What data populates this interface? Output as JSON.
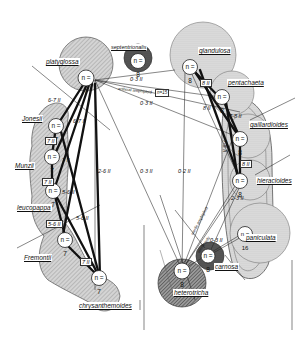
{
  "diagram": {
    "type": "species relationship / hybridization diagram",
    "colors": {
      "hatch_light": "#bdbdbd",
      "hatch_dark": "#555555",
      "line": "#111111",
      "background": "#ffffff"
    },
    "species": [
      {
        "id": "platyglossa",
        "label": "platyglossa",
        "chromosome": "n = 7",
        "shade": "dark-hatched"
      },
      {
        "id": "septentrionalis",
        "label": "septentrionalis",
        "chromosome": "n = 8",
        "shade": "dark"
      },
      {
        "id": "glandulosa",
        "label": "glandulosa",
        "chromosome": "n = 8",
        "shade": "light"
      },
      {
        "id": "pentachaeta",
        "label": "pentachaeta",
        "chromosome": "n = 8",
        "shade": "light"
      },
      {
        "id": "gaillardioides",
        "label": "gaillardioides",
        "chromosome": "n = 8",
        "shade": "light"
      },
      {
        "id": "hieracioides",
        "label": "hieracioides",
        "chromosome": "n = 8",
        "shade": "light"
      },
      {
        "id": "paniculata",
        "label": "paniculata",
        "chromosome": "n = 16",
        "shade": "light"
      },
      {
        "id": "carnosa",
        "label": "carnosa",
        "chromosome": "n = 8",
        "shade": "dark"
      },
      {
        "id": "heterotricha",
        "label": "heterotricha",
        "chromosome": "n = 8",
        "shade": "dark"
      },
      {
        "id": "Jonesii",
        "label": "Jonesii",
        "chromosome": "n = 7",
        "shade": "hatched"
      },
      {
        "id": "Munzii",
        "label": "Munzii",
        "chromosome": "n = 7",
        "shade": "hatched"
      },
      {
        "id": "leucopappa",
        "label": "leucopappa",
        "chromosome": "n = 7",
        "shade": "hatched"
      },
      {
        "id": "Fremontii",
        "label": "Fremontii",
        "chromosome": "n = 7",
        "shade": "hatched"
      },
      {
        "id": "chrysanthemoides",
        "label": "chrysanthemoides",
        "chromosome": "n = 7",
        "shade": "hatched"
      }
    ],
    "edge_labels": [
      {
        "text": "0·3 II",
        "between": "platyglossa–pentachaeta"
      },
      {
        "text": "artificial amphiploid",
        "between": "platyglossa–hybrid"
      },
      {
        "text": "n=15",
        "between": "amphiploid"
      },
      {
        "text": "0·3 II",
        "between": "platyglossa–gaillardioides"
      },
      {
        "text": "8 II",
        "between": "glandulosa–pentachaeta"
      },
      {
        "text": "8 II",
        "between": "glandulosa–gaillardioides"
      },
      {
        "text": "7-8 II",
        "between": "pentachaeta–gaillardioides"
      },
      {
        "text": "7-8 II",
        "between": "pentachaeta–hieracioides"
      },
      {
        "text": "8 II",
        "between": "gaillardioides–hieracioides"
      },
      {
        "text": "2-3 II",
        "between": "hieracioides–paniculata"
      },
      {
        "text": "0-3 II",
        "between": "paniculata–carnosa"
      },
      {
        "text": "6-7 II",
        "between": "platyglossa–Jonesii"
      },
      {
        "text": "6-7 II",
        "between": "Jonesii–Munzii"
      },
      {
        "text": "7 II",
        "between": "Jonesii–Munzii"
      },
      {
        "text": "7 II",
        "between": "Munzii–platyglossa"
      },
      {
        "text": "7 II",
        "between": "Munzii–leucopappa"
      },
      {
        "text": "5-6 II",
        "between": "leucopappa–platyglossa"
      },
      {
        "text": "5-6 II",
        "between": "leucopappa–Fremontii"
      },
      {
        "text": "5-6 II",
        "between": "leucopappa–chrysanthemoides"
      },
      {
        "text": "7 II",
        "between": "Fremontii–chrysanthemoides"
      },
      {
        "text": "2-6 II",
        "between": "platyglossa–chrysanthemoides"
      },
      {
        "text": "0·3 II",
        "between": "platyglossa–heterotricha"
      },
      {
        "text": "0·2 II",
        "between": "glandulosa–heterotricha"
      },
      {
        "text": "sterile amphiploid",
        "between": "heterotricha–hieracioides"
      },
      {
        "text": "sterile only",
        "between": "heterotricha–paniculata"
      }
    ]
  }
}
